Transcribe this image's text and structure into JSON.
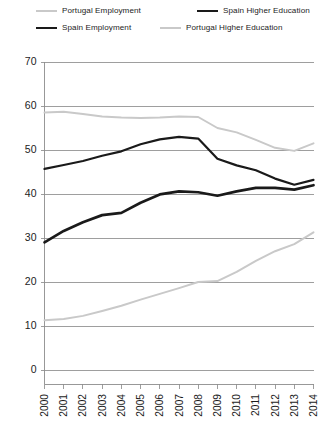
{
  "chart_data": {
    "type": "line",
    "title": "",
    "xlabel": "",
    "ylabel": "",
    "x": [
      2000,
      2001,
      2002,
      2003,
      2004,
      2005,
      2006,
      2007,
      2008,
      2009,
      2010,
      2011,
      2012,
      2013,
      2014
    ],
    "categories": [
      "2000",
      "2001",
      "2002",
      "2003",
      "2004",
      "2005",
      "2006",
      "2007",
      "2008",
      "2009",
      "2010",
      "2011",
      "2012",
      "2013",
      "2014"
    ],
    "xlim": [
      2000,
      2014
    ],
    "ylim": [
      0,
      70
    ],
    "yticks": [
      0,
      10,
      20,
      30,
      40,
      50,
      60,
      70
    ],
    "ytick_labels": [
      "0",
      "10",
      "20",
      "30",
      "40",
      "50",
      "60",
      "70"
    ],
    "grid": "horizontal",
    "legend_position": "top",
    "series": [
      {
        "name": "Portugal Employment",
        "color": "#c9c9c9",
        "width": 2.0,
        "values": [
          58.5,
          58.7,
          58.2,
          57.6,
          57.4,
          57.3,
          57.4,
          57.6,
          57.5,
          55.0,
          54.0,
          52.3,
          50.5,
          49.8,
          51.5
        ]
      },
      {
        "name": "Spain Employment",
        "color": "#1a1a1a",
        "width": 2.2,
        "values": [
          45.7,
          46.6,
          47.5,
          48.7,
          49.7,
          51.3,
          52.4,
          53.0,
          52.6,
          48.0,
          46.5,
          45.4,
          43.5,
          42.1,
          43.2
        ]
      },
      {
        "name": "Spain Higher Education",
        "color": "#1a1a1a",
        "width": 2.7,
        "values": [
          29.0,
          31.6,
          33.6,
          35.2,
          35.7,
          38.0,
          39.9,
          40.6,
          40.4,
          39.6,
          40.6,
          41.4,
          41.4,
          41.0,
          42.0
        ]
      },
      {
        "name": "Portugal Higher Education",
        "color": "#c9c9c9",
        "width": 2.0,
        "values": [
          11.3,
          11.6,
          12.3,
          13.4,
          14.6,
          16.0,
          17.3,
          18.6,
          20.0,
          20.2,
          22.3,
          24.8,
          27.0,
          28.6,
          31.3
        ]
      }
    ]
  },
  "legend": {
    "items": [
      {
        "label": "Portugal Employment",
        "color": "#c9c9c9",
        "width": 2.0
      },
      {
        "label": "Spain Higher Education",
        "color": "#1a1a1a",
        "width": 2.7
      },
      {
        "label": "Spain Employment",
        "color": "#1a1a1a",
        "width": 2.2
      },
      {
        "label": "Portugal Higher Education",
        "color": "#c9c9c9",
        "width": 2.0
      }
    ]
  }
}
